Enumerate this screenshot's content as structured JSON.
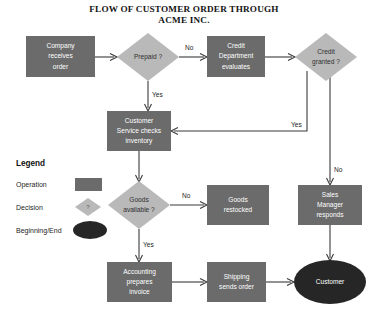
{
  "title": {
    "line1": "FLOW OF CUSTOMER ORDER THROUGH",
    "line2": "ACME INC."
  },
  "colors": {
    "operation_fill": "#6b6b6b",
    "decision_fill": "#b9b9b9",
    "terminator_fill": "#262626",
    "edge_stroke": "#3a3a3a",
    "background": "#ffffff",
    "operation_text": "#ffffff",
    "decision_text": "#2f2f2f"
  },
  "nodes": [
    {
      "id": "company-receives-order",
      "type": "operation",
      "lines": [
        "Company",
        "receives",
        "order"
      ]
    },
    {
      "id": "prepaid",
      "type": "decision",
      "lines": [
        "Prepaid ?"
      ]
    },
    {
      "id": "credit-department-evaluates",
      "type": "operation",
      "lines": [
        "Credit",
        "Department",
        "evaluates"
      ]
    },
    {
      "id": "credit-granted",
      "type": "decision",
      "lines": [
        "Credit",
        "granted ?"
      ]
    },
    {
      "id": "customer-service-checks-inventory",
      "type": "operation",
      "lines": [
        "Customer",
        "Service checks",
        "inventory"
      ]
    },
    {
      "id": "goods-available",
      "type": "decision",
      "lines": [
        "Goods",
        "available ?"
      ]
    },
    {
      "id": "goods-restocked",
      "type": "operation",
      "lines": [
        "Goods",
        "restocked"
      ]
    },
    {
      "id": "sales-manager-responds",
      "type": "operation",
      "lines": [
        "Sales",
        "Manager",
        "responds"
      ]
    },
    {
      "id": "accounting-prepares-invoice",
      "type": "operation",
      "lines": [
        "Accounting",
        "prepares",
        "invoice"
      ]
    },
    {
      "id": "shipping-sends-order",
      "type": "operation",
      "lines": [
        "Shipping",
        "sends order"
      ]
    },
    {
      "id": "customer",
      "type": "terminator",
      "lines": [
        "Customer"
      ]
    }
  ],
  "edge_labels": {
    "prepaid_no": "No",
    "prepaid_yes": "Yes",
    "credit_granted_yes": "Yes",
    "credit_granted_no": "No",
    "goods_available_no": "No",
    "goods_available_yes": "Yes"
  },
  "legend": {
    "heading": "Legend",
    "items": [
      {
        "label": "Operation",
        "shape": "rectangle"
      },
      {
        "label": "Decision",
        "shape": "diamond",
        "glyph": "?"
      },
      {
        "label": "Beginning/End",
        "shape": "ellipse"
      }
    ]
  }
}
